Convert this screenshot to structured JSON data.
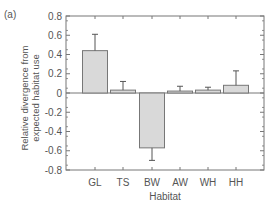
{
  "chart_data": {
    "type": "bar",
    "panel_label": "(a)",
    "title": "",
    "xlabel": "Habitat",
    "ylabel": "Relative divergence from expected habitat use",
    "ylabel_lines": [
      "Relative divergence from",
      "expected habitat use"
    ],
    "categories": [
      "GL",
      "TS",
      "BW",
      "AW",
      "WH",
      "HH"
    ],
    "values": [
      0.44,
      0.03,
      -0.57,
      0.02,
      0.03,
      0.08
    ],
    "error_bars": [
      0.17,
      0.09,
      0.13,
      0.05,
      0.03,
      0.15
    ],
    "ylim": [
      -0.8,
      0.8
    ],
    "yticks": [
      -0.8,
      -0.6,
      -0.4,
      -0.2,
      0,
      0.2,
      0.4,
      0.6,
      0.8
    ],
    "ytick_labels": [
      "-0.8",
      "-0.6",
      "-0.4",
      "-0.2",
      "0",
      "0.2",
      "0.4",
      "0.6",
      "0.8"
    ],
    "grid": false,
    "legend": null,
    "colors": {
      "bar_fill": "#d9d9d9",
      "bar_edge": "#777777",
      "axis": "#777777",
      "text": "#555555"
    }
  }
}
